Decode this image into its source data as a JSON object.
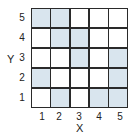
{
  "diagram": {
    "type": "grid",
    "rows": 5,
    "cols": 5,
    "colors": {
      "shaded": "#d9e5ee",
      "empty": "#ffffff",
      "line": "#2a2a2a"
    },
    "xlabel": "X",
    "ylabel": "Y",
    "xticks": [
      "1",
      "2",
      "3",
      "4",
      "5"
    ],
    "yticks": [
      "5",
      "4",
      "3",
      "2",
      "1"
    ],
    "shaded_cells": [
      {
        "x": 1,
        "y": 5
      },
      {
        "x": 2,
        "y": 5
      },
      {
        "x": 2,
        "y": 4
      },
      {
        "x": 3,
        "y": 4
      },
      {
        "x": 3,
        "y": 3
      },
      {
        "x": 5,
        "y": 3
      },
      {
        "x": 1,
        "y": 2
      },
      {
        "x": 5,
        "y": 2
      },
      {
        "x": 2,
        "y": 1
      },
      {
        "x": 4,
        "y": 1
      },
      {
        "x": 5,
        "y": 1
      }
    ]
  }
}
